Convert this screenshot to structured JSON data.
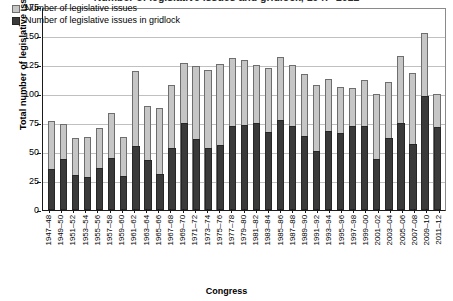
{
  "chart_data": {
    "type": "bar",
    "title": "Number of legislative issues and gridlock, 1947–2012",
    "subtitle": "",
    "xlabel": "Congress",
    "ylabel": "Total number of legislative issues",
    "ylim": [
      0,
      175
    ],
    "yticks": [
      0,
      25,
      50,
      75,
      100,
      125,
      150,
      175
    ],
    "grid": true,
    "legend_position": "top-left",
    "categories": [
      "1947–48",
      "1949–50",
      "1951–52",
      "1953–54",
      "1955–56",
      "1957–58",
      "1959–60",
      "1961–62",
      "1963–64",
      "1965–66",
      "1967–68",
      "1969–70",
      "1971–72",
      "1973–74",
      "1975–76",
      "1977–78",
      "1979–80",
      "1981–82",
      "1983–84",
      "1985–86",
      "1987–88",
      "1989–90",
      "1991–92",
      "1993–94",
      "1995–96",
      "1997–98",
      "1999–00",
      "2001–02",
      "2003–04",
      "2005–06",
      "2007–08",
      "2009–10",
      "2011–12"
    ],
    "series": [
      {
        "name": "Number of legislative issues",
        "color": "#c6c6c6",
        "values": [
          77,
          74,
          62,
          63,
          71,
          84,
          63,
          120,
          90,
          88,
          108,
          127,
          124,
          121,
          126,
          131,
          129,
          125,
          122,
          132,
          125,
          117,
          108,
          113,
          106,
          105,
          112,
          100,
          110,
          133,
          118,
          153,
          100
        ]
      },
      {
        "name": "Number of legislative issues in gridlock",
        "color": "#3a3a3a",
        "values": [
          35,
          44,
          30,
          28,
          36,
          45,
          29,
          55,
          43,
          31,
          53,
          75,
          61,
          53,
          56,
          72,
          73,
          75,
          67,
          77,
          72,
          64,
          51,
          68,
          66,
          72,
          72,
          44,
          62,
          75,
          57,
          98,
          71
        ]
      }
    ]
  },
  "legend": {
    "items": [
      {
        "label": "Number of legislative issues"
      },
      {
        "label": "Number of legislative issues in gridlock"
      }
    ]
  },
  "colors": {
    "total_bar": "#c6c6c6",
    "gridlock_bar": "#3a3a3a",
    "axis": "#1a1a1a",
    "gridline": "#c0c0c0",
    "background": "#ffffff"
  }
}
